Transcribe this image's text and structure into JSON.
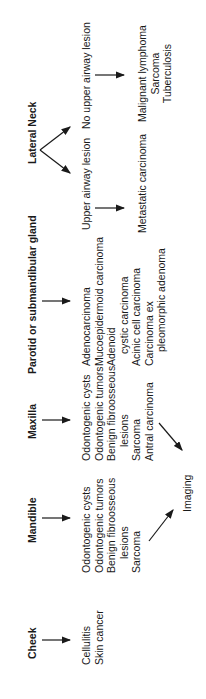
{
  "columns": [
    {
      "header": "Cheek",
      "items": [
        "Cellulitis",
        "Skin cancer"
      ]
    },
    {
      "header": "Mandible",
      "items": [
        "Odontogenic cysts",
        "Odontogenic tumors",
        "Benign fibroosseous",
        "lesions",
        "Sarcoma"
      ]
    },
    {
      "header": "Maxilla",
      "items": [
        "Odontogenic cysts",
        "Odontogenic tumors",
        "Benign fibroosseous",
        "lesions",
        "Sarcoma",
        "Antral carcinoma"
      ]
    },
    {
      "header": "Parotid or submandibular gland",
      "items": [
        "Adenocarcinoma",
        "Mucoepidermoid carcinoma",
        "Adenoid",
        "cystic carcinoma",
        "Acinic cell carcinoma",
        "Carcinoma ex",
        "pleomorphic adenoma"
      ]
    },
    {
      "header": "Lateral Neck",
      "branches": [
        {
          "label": "Upper airway lesion",
          "items": [
            "Metastatic carcinoma"
          ]
        },
        {
          "label": "No upper airway lesion",
          "items": [
            "Malignant lymphoma",
            "Sarcoma",
            "Tuberculosis"
          ]
        }
      ]
    }
  ],
  "imaging_label": "Imaging"
}
